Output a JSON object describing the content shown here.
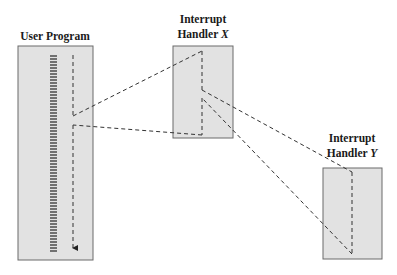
{
  "diagram": {
    "type": "sequential interrupt processing",
    "colors": {
      "box_fill": "#e2e2e2",
      "box_stroke": "#6a6a6a",
      "line": "#333333",
      "background": "#ffffff"
    },
    "nodes": [
      {
        "id": "user-program",
        "title": "User Program"
      },
      {
        "id": "handler-x",
        "title_line1": "Interrupt",
        "title_line2_prefix": "Handler ",
        "title_line2_var": "X"
      },
      {
        "id": "handler-y",
        "title_line1": "Interrupt",
        "title_line2_prefix": "Handler ",
        "title_line2_var": "Y"
      }
    ],
    "edges": [
      {
        "from": "user-program",
        "to": "handler-x",
        "kind": "interrupt"
      },
      {
        "from": "handler-x",
        "to": "user-program",
        "kind": "return"
      },
      {
        "from": "handler-x",
        "to": "handler-y",
        "kind": "interrupt"
      },
      {
        "from": "handler-y",
        "to": "handler-x",
        "kind": "return"
      }
    ]
  }
}
